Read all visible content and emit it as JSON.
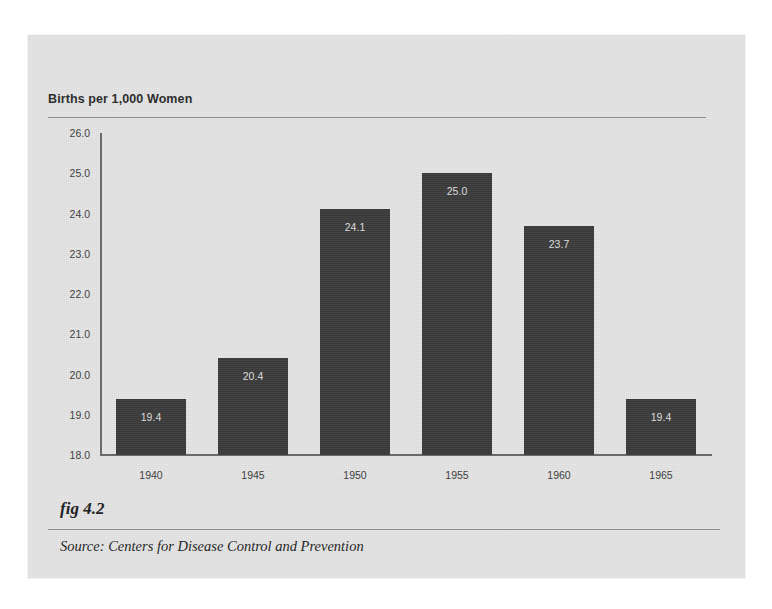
{
  "figure": {
    "fig_label": "fig 4.2",
    "source_note": "Source:  Centers for Disease Control and Prevention"
  },
  "chart_data": {
    "type": "bar",
    "title": "Births per 1,000 Women",
    "xlabel": "",
    "ylabel": "Births per 1,000 Women",
    "categories": [
      "1940",
      "1945",
      "1950",
      "1955",
      "1960",
      "1965"
    ],
    "values": [
      19.4,
      20.4,
      24.1,
      25.0,
      23.7,
      19.4
    ],
    "value_labels": [
      "19.4",
      "20.4",
      "24.1",
      "25.0",
      "23.7",
      "19.4"
    ],
    "ylim": [
      18.0,
      26.0
    ],
    "ytick_labels": [
      "26.0",
      "25.0",
      "24.0",
      "23.0",
      "22.0",
      "21.0",
      "20.0",
      "19.0",
      "18.0"
    ],
    "yticks": [
      26.0,
      25.0,
      24.0,
      23.0,
      22.0,
      21.0,
      20.0,
      19.0,
      18.0
    ],
    "grid": false,
    "legend": null,
    "bar_color": "#3c3c3c",
    "value_label_color": "#dcdcdc",
    "axis_color": "#6a6a6a",
    "panel_color": "#d9d9d9"
  }
}
